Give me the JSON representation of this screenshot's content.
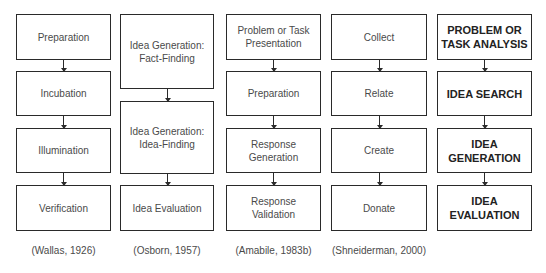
{
  "columns": [
    {
      "boxes": [
        "Preparation",
        "Incubation",
        "Illumination",
        "Verification"
      ],
      "caption": "(Wallas, 1926)"
    },
    {
      "boxes": [
        "Idea Generation:\nFact-Finding",
        "Idea Generation:\nIdea-Finding",
        "Idea Evaluation"
      ],
      "caption": "(Osborn, 1957)"
    },
    {
      "boxes": [
        "Problem or Task\nPresentation",
        "Preparation",
        "Response\nGeneration",
        "Response\nValidation"
      ],
      "caption": "(Amabile, 1983b)"
    },
    {
      "boxes": [
        "Collect",
        "Relate",
        "Create",
        "Donate"
      ],
      "caption": "(Shneiderman, 2000)"
    },
    {
      "boxes": [
        "PROBLEM OR\nTASK ANALYSIS",
        "IDEA SEARCH",
        "IDEA\nGENERATION",
        "IDEA\nEVALUATION"
      ],
      "caption": ""
    }
  ],
  "colors": {
    "border": "#2a2a2a",
    "text": "#4a4a4a",
    "background": "#ffffff"
  }
}
